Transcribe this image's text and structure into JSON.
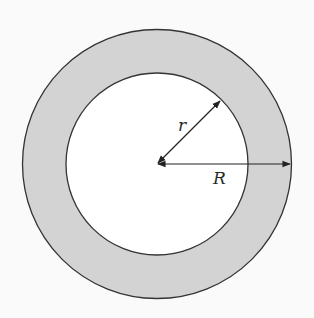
{
  "diagram": {
    "type": "annulus",
    "center": [
      157,
      164
    ],
    "outer_radius": 135,
    "inner_radius": 91,
    "labels": {
      "inner_radius": "r",
      "outer_radius": "R"
    },
    "colors": {
      "background": "#fafafa",
      "ring_fill": "#d3d3d3",
      "inner_fill": "#ffffff",
      "stroke": "#333333",
      "arrow": "#222222"
    }
  }
}
